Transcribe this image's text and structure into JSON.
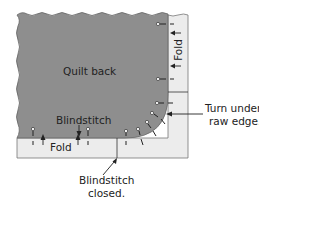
{
  "diagram": {
    "labels": {
      "quilt_back": "Quilt back",
      "fold_right": "Fold",
      "blindstitch": "Blindstitch",
      "fold_bottom": "Fold",
      "turn_under_line1": "Turn under",
      "turn_under_line2": "raw edge.",
      "blindstitch_closed_line1": "Blindstitch",
      "blindstitch_closed_line2": "closed."
    },
    "colors": {
      "quilt_back": "#8e8e8e",
      "fold_strip": "#ececec",
      "outline": "#555555",
      "text": "#222222"
    }
  }
}
